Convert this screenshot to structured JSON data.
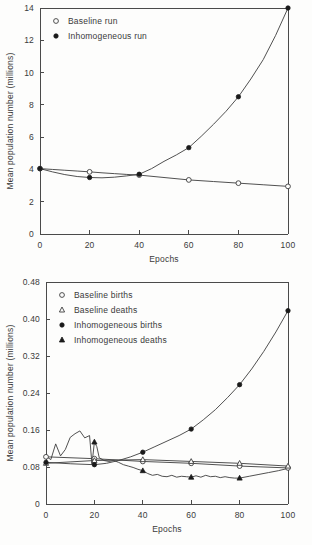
{
  "page": {
    "background_color": "#fdfdfc",
    "ink_color": "#3d3d3d"
  },
  "chart_data": [
    {
      "id": "top",
      "type": "line",
      "title": "",
      "xlabel": "Epochs",
      "ylabel": "Mean population number (millions)",
      "xlim": [
        0,
        100
      ],
      "ylim": [
        0,
        14
      ],
      "xticks": [
        0,
        20,
        40,
        60,
        80,
        100
      ],
      "xtick_labels": [
        "0",
        "20",
        "40",
        "60",
        "80",
        "100"
      ],
      "yticks": [
        0,
        2,
        4,
        6,
        8,
        10,
        12,
        14
      ],
      "ytick_labels": [
        "0",
        "2",
        "4",
        "6",
        "8",
        "10",
        "12",
        "14"
      ],
      "grid": false,
      "frame": "box",
      "legend_position": "upper-left",
      "series": [
        {
          "name": "Baseline run",
          "marker": "open-circle",
          "legend_label": "Baseline run",
          "x": [
            0,
            20,
            40,
            60,
            80,
            100
          ],
          "values": [
            4.05,
            3.85,
            3.65,
            3.35,
            3.15,
            2.95
          ],
          "line_x": [
            0,
            5,
            10,
            15,
            20,
            25,
            30,
            35,
            40,
            50,
            60,
            70,
            80,
            90,
            100
          ],
          "line_y": [
            4.05,
            4.0,
            3.95,
            3.9,
            3.85,
            3.79,
            3.74,
            3.69,
            3.65,
            3.5,
            3.35,
            3.25,
            3.15,
            3.05,
            2.95
          ]
        },
        {
          "name": "Inhomogeneous run",
          "marker": "filled-circle",
          "legend_label": "Inhomogeneous run",
          "x": [
            0,
            20,
            40,
            60,
            80,
            100
          ],
          "values": [
            4.05,
            3.5,
            3.7,
            5.35,
            8.5,
            14.0
          ],
          "line_x": [
            0,
            5,
            10,
            15,
            20,
            25,
            30,
            35,
            40,
            45,
            50,
            55,
            60,
            65,
            70,
            75,
            80,
            85,
            90,
            95,
            100
          ],
          "line_y": [
            4.05,
            3.85,
            3.68,
            3.56,
            3.5,
            3.48,
            3.52,
            3.6,
            3.7,
            4.05,
            4.5,
            4.9,
            5.35,
            6.05,
            6.8,
            7.6,
            8.5,
            9.6,
            10.8,
            12.3,
            14.0
          ]
        }
      ]
    },
    {
      "id": "bottom",
      "type": "line",
      "title": "",
      "xlabel": "Epochs",
      "ylabel": "Mean population number (millions)",
      "xlim": [
        0,
        100
      ],
      "ylim": [
        0,
        0.48
      ],
      "xticks": [
        0,
        20,
        40,
        60,
        80,
        100
      ],
      "xtick_labels": [
        "0",
        "20",
        "40",
        "60",
        "80",
        "100"
      ],
      "yticks": [
        0,
        0.08,
        0.16,
        0.24,
        0.32,
        0.4,
        0.48
      ],
      "ytick_labels": [
        "0",
        "0.08",
        "0.16",
        "0.24",
        "0.32",
        "0.40",
        "0.48"
      ],
      "grid": false,
      "frame": "box",
      "legend_position": "upper-left",
      "series": [
        {
          "name": "Baseline births",
          "marker": "open-circle",
          "legend_label": "Baseline births",
          "x": [
            0,
            20,
            40,
            60,
            80,
            100
          ],
          "values": [
            0.102,
            0.098,
            0.092,
            0.088,
            0.082,
            0.078
          ],
          "line_x": [
            0,
            20,
            40,
            60,
            80,
            100
          ],
          "line_y": [
            0.102,
            0.098,
            0.092,
            0.088,
            0.082,
            0.078
          ]
        },
        {
          "name": "Baseline deaths",
          "marker": "open-triangle",
          "legend_label": "Baseline deaths",
          "x": [
            0,
            20,
            40,
            60,
            80,
            100
          ],
          "values": [
            0.088,
            0.094,
            0.096,
            0.092,
            0.088,
            0.082
          ],
          "line_x": [
            0,
            20,
            40,
            60,
            80,
            100
          ],
          "line_y": [
            0.088,
            0.094,
            0.096,
            0.092,
            0.088,
            0.082
          ]
        },
        {
          "name": "Inhomogeneous births",
          "marker": "filled-circle",
          "legend_label": "Inhomogeneous births",
          "x": [
            0,
            20,
            40,
            60,
            80,
            100
          ],
          "values": [
            0.09,
            0.085,
            0.112,
            0.162,
            0.258,
            0.418
          ],
          "line_x": [
            0,
            10,
            20,
            25,
            30,
            35,
            40,
            45,
            50,
            55,
            60,
            65,
            70,
            75,
            80,
            85,
            90,
            95,
            100
          ],
          "line_y": [
            0.09,
            0.087,
            0.085,
            0.088,
            0.094,
            0.102,
            0.112,
            0.124,
            0.136,
            0.148,
            0.162,
            0.182,
            0.204,
            0.23,
            0.258,
            0.292,
            0.33,
            0.372,
            0.418
          ]
        },
        {
          "name": "Inhomogeneous deaths",
          "marker": "filled-triangle",
          "legend_label": "Inhomogeneous deaths",
          "x": [
            20,
            40,
            60,
            80
          ],
          "values": [
            0.134,
            0.072,
            0.058,
            0.056
          ],
          "line_x": [
            0,
            2,
            4,
            6,
            8,
            10,
            12,
            14,
            16,
            18,
            19,
            20,
            21,
            22,
            24,
            26,
            28,
            30,
            32,
            34,
            36,
            38,
            40,
            42,
            44,
            46,
            48,
            50,
            52,
            54,
            56,
            58,
            60,
            62,
            64,
            66,
            68,
            70,
            72,
            74,
            76,
            78,
            80,
            84,
            88,
            92,
            96,
            100
          ],
          "line_y": [
            0.103,
            0.096,
            0.13,
            0.104,
            0.118,
            0.144,
            0.152,
            0.158,
            0.143,
            0.148,
            0.086,
            0.134,
            0.124,
            0.1,
            0.094,
            0.092,
            0.094,
            0.09,
            0.085,
            0.082,
            0.079,
            0.075,
            0.072,
            0.066,
            0.062,
            0.064,
            0.06,
            0.059,
            0.062,
            0.058,
            0.06,
            0.059,
            0.058,
            0.061,
            0.058,
            0.062,
            0.059,
            0.06,
            0.057,
            0.059,
            0.057,
            0.056,
            0.056,
            0.06,
            0.064,
            0.068,
            0.072,
            0.077
          ]
        }
      ]
    }
  ]
}
